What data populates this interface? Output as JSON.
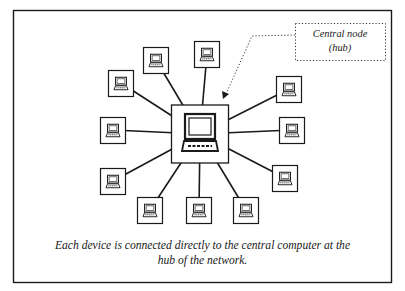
{
  "diagram": {
    "type": "star-network-topology",
    "hub": {
      "label": "Central node (hub)",
      "label_lines": [
        "Central node",
        "(hub)"
      ],
      "icon": "desktop-computer-icon"
    },
    "devices": [
      {
        "id": "device-top",
        "icon": "computer-icon"
      },
      {
        "id": "device-top-left",
        "icon": "computer-icon"
      },
      {
        "id": "device-upper-left",
        "icon": "computer-icon"
      },
      {
        "id": "device-left",
        "icon": "computer-icon"
      },
      {
        "id": "device-lower-left",
        "icon": "computer-icon"
      },
      {
        "id": "device-bottom-left",
        "icon": "computer-icon"
      },
      {
        "id": "device-bottom",
        "icon": "computer-icon"
      },
      {
        "id": "device-bottom-right",
        "icon": "computer-icon"
      },
      {
        "id": "device-lower-right",
        "icon": "computer-icon"
      },
      {
        "id": "device-right",
        "icon": "computer-icon"
      },
      {
        "id": "device-upper-right",
        "icon": "computer-icon"
      }
    ],
    "connections": "each device linked directly to hub",
    "caption_lines": [
      "Each device is connected directly to the central computer at the",
      "hub of the network."
    ],
    "colors": {
      "line": "#1a1a1a",
      "background": "#ffffff"
    }
  }
}
